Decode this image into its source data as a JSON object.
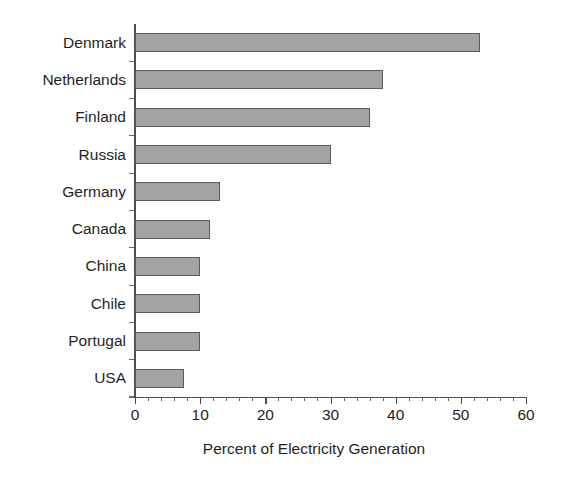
{
  "chart_data": {
    "type": "bar",
    "orientation": "horizontal",
    "title": "",
    "xlabel": "Percent of Electricity Generation",
    "ylabel": "",
    "xlim": [
      0,
      60
    ],
    "xticks": [
      0,
      10,
      20,
      30,
      40,
      50,
      60
    ],
    "xtick_labels": [
      "0",
      "10",
      "20",
      "30",
      "40",
      "50",
      "60"
    ],
    "minor_tick_step": 2,
    "grid": false,
    "legend": false,
    "categories": [
      "Denmark",
      "Netherlands",
      "Finland",
      "Russia",
      "Germany",
      "Canada",
      "China",
      "Chile",
      "Portugal",
      "USA"
    ],
    "values": [
      53,
      38,
      36,
      30,
      13,
      11.5,
      10,
      10,
      10,
      7.5
    ],
    "series": [
      {
        "name": "Percent of Electricity Generation",
        "values": [
          53,
          38,
          36,
          30,
          13,
          11.5,
          10,
          10,
          10,
          7.5
        ]
      }
    ]
  },
  "style": {
    "bar_fill": "#a3a3a3",
    "bar_border": "#5c5c5c",
    "axis_color": "#4d4d4d",
    "text_color": "#1f1f1f",
    "background": "#ffffff"
  }
}
